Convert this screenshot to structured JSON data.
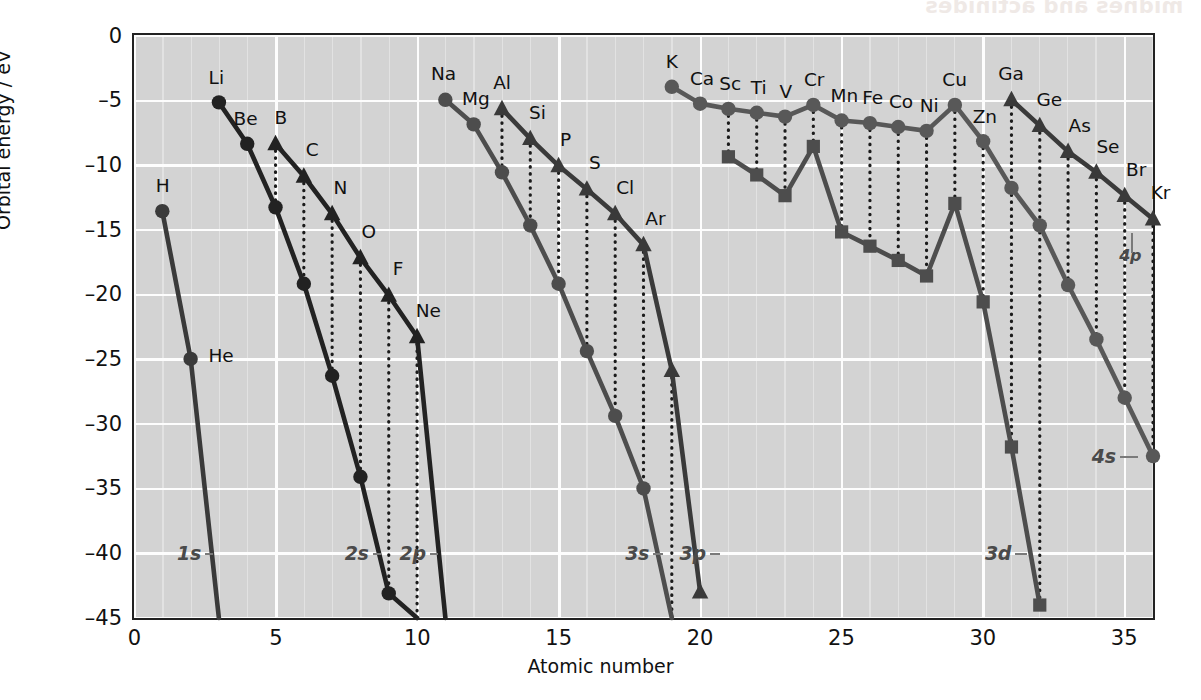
{
  "chart_data": {
    "type": "line",
    "title": "",
    "xlabel": "Atomic number",
    "ylabel": "Orbital energy / eV",
    "xlim": [
      0,
      36
    ],
    "ylim": [
      -45,
      0
    ],
    "xticks": [
      0,
      5,
      10,
      15,
      20,
      25,
      30,
      35
    ],
    "yticks": [
      0,
      -5,
      -10,
      -15,
      -20,
      -25,
      -30,
      -35,
      -40,
      -45
    ],
    "ytick_labels": [
      "0",
      "–5",
      "–10",
      "–15",
      "–20",
      "–25",
      "–30",
      "–35",
      "–40",
      "–45"
    ],
    "xtick_labels": [
      "0",
      "5",
      "10",
      "15",
      "20",
      "25",
      "30",
      "35"
    ],
    "grid": true,
    "grid_color": "#f2f2f2",
    "plot_bg": "#d3d3d3",
    "legend": "inline-annotations",
    "series": [
      {
        "name": "1s",
        "marker": "circle",
        "color": "#3a3a3a",
        "x": [
          1,
          2,
          3
        ],
        "y": [
          -13.6,
          -25.0,
          -45.0
        ],
        "clipped_below": true
      },
      {
        "name": "2s",
        "marker": "circle",
        "color": "#222222",
        "x": [
          3,
          4,
          5,
          6,
          7,
          8,
          9,
          10
        ],
        "y": [
          -5.2,
          -8.4,
          -13.3,
          -19.2,
          -26.3,
          -34.1,
          -43.1,
          -45.0
        ],
        "clipped_below": true
      },
      {
        "name": "2p",
        "marker": "triangle",
        "color": "#222222",
        "x": [
          5,
          6,
          7,
          8,
          9,
          10,
          11
        ],
        "y": [
          -8.4,
          -10.9,
          -13.8,
          -17.2,
          -20.1,
          -23.3,
          -45.0
        ],
        "clipped_below": true
      },
      {
        "name": "3s",
        "marker": "circle",
        "color": "#4d4d4d",
        "x": [
          11,
          12,
          13,
          14,
          15,
          16,
          17,
          18,
          19
        ],
        "y": [
          -5.0,
          -6.9,
          -10.6,
          -14.7,
          -19.2,
          -24.4,
          -29.4,
          -35.0,
          -45.0
        ],
        "clipped_below": true
      },
      {
        "name": "3p",
        "marker": "triangle",
        "color": "#3a3a3a",
        "x": [
          13,
          14,
          15,
          16,
          17,
          18,
          19,
          20
        ],
        "y": [
          -5.7,
          -8.0,
          -10.1,
          -11.9,
          -13.8,
          -16.2,
          -25.9,
          -43.0
        ],
        "clipped_below": false
      },
      {
        "name": "3d",
        "marker": "square",
        "color": "#4d4d4d",
        "x": [
          21,
          22,
          23,
          24,
          25,
          26,
          27,
          28,
          29,
          30,
          31,
          32
        ],
        "y": [
          -9.4,
          -10.8,
          -12.4,
          -8.6,
          -15.2,
          -16.3,
          -17.4,
          -18.6,
          -13.0,
          -20.6,
          -31.8,
          -44.0
        ],
        "clipped_below": false
      },
      {
        "name": "4s",
        "marker": "circle",
        "color": "#585858",
        "x": [
          19,
          20,
          21,
          22,
          23,
          24,
          25,
          26,
          27,
          28,
          29,
          30,
          31,
          32,
          33,
          34,
          35,
          36
        ],
        "y": [
          -4.0,
          -5.3,
          -5.7,
          -6.0,
          -6.3,
          -5.4,
          -6.6,
          -6.8,
          -7.1,
          -7.4,
          -5.4,
          -8.2,
          -11.8,
          -14.7,
          -19.3,
          -23.5,
          -28.0,
          -32.5
        ],
        "clipped_below": false
      },
      {
        "name": "4p",
        "marker": "triangle",
        "color": "#3a3a3a",
        "x": [
          31,
          32,
          33,
          34,
          35,
          36
        ],
        "y": [
          -5.0,
          -7.0,
          -9.0,
          -10.6,
          -12.4,
          -14.2
        ],
        "clipped_below": false
      }
    ],
    "point_labels": [
      {
        "text": "H",
        "x": 1,
        "y": -13.6,
        "dx": 0,
        "dy": -16
      },
      {
        "text": "He",
        "x": 2,
        "y": -25.0,
        "dx": 30,
        "dy": 6
      },
      {
        "text": "Li",
        "x": 3,
        "y": -5.2,
        "dx": -3,
        "dy": -16
      },
      {
        "text": "Be",
        "x": 4,
        "y": -8.4,
        "dx": -2,
        "dy": -16
      },
      {
        "text": "B",
        "x": 5,
        "y": -8.4,
        "dx": 5,
        "dy": -17
      },
      {
        "text": "C",
        "x": 6,
        "y": -10.9,
        "dx": 8,
        "dy": -17
      },
      {
        "text": "N",
        "x": 7,
        "y": -13.8,
        "dx": 8,
        "dy": -17
      },
      {
        "text": "O",
        "x": 8,
        "y": -17.2,
        "dx": 8,
        "dy": -17
      },
      {
        "text": "F",
        "x": 9,
        "y": -20.1,
        "dx": 9,
        "dy": -17
      },
      {
        "text": "Ne",
        "x": 10,
        "y": -23.3,
        "dx": 11,
        "dy": -17
      },
      {
        "text": "Na",
        "x": 11,
        "y": -5.0,
        "dx": -2,
        "dy": -17
      },
      {
        "text": "Mg",
        "x": 12,
        "y": -6.9,
        "dx": 2,
        "dy": -17
      },
      {
        "text": "Al",
        "x": 13,
        "y": -5.7,
        "dx": 0,
        "dy": -17
      },
      {
        "text": "Si",
        "x": 14,
        "y": -8.0,
        "dx": 7,
        "dy": -17
      },
      {
        "text": "P",
        "x": 15,
        "y": -10.1,
        "dx": 7,
        "dy": -17
      },
      {
        "text": "S",
        "x": 16,
        "y": -11.9,
        "dx": 8,
        "dy": -17
      },
      {
        "text": "Cl",
        "x": 17,
        "y": -13.8,
        "dx": 10,
        "dy": -17
      },
      {
        "text": "Ar",
        "x": 18,
        "y": -16.2,
        "dx": 12,
        "dy": -17
      },
      {
        "text": "K",
        "x": 19,
        "y": -4.0,
        "dx": 0,
        "dy": -16
      },
      {
        "text": "Ca",
        "x": 20,
        "y": -5.3,
        "dx": 2,
        "dy": -16
      },
      {
        "text": "Sc",
        "x": 21,
        "y": -5.7,
        "dx": 2,
        "dy": -16
      },
      {
        "text": "Ti",
        "x": 22,
        "y": -6.0,
        "dx": 2,
        "dy": -16
      },
      {
        "text": "V",
        "x": 23,
        "y": -6.3,
        "dx": 1,
        "dy": -16
      },
      {
        "text": "Cr",
        "x": 24,
        "y": -5.4,
        "dx": 1,
        "dy": -16
      },
      {
        "text": "Mn",
        "x": 25,
        "y": -6.6,
        "dx": 3,
        "dy": -16
      },
      {
        "text": "Fe",
        "x": 26,
        "y": -6.8,
        "dx": 3,
        "dy": -16
      },
      {
        "text": "Co",
        "x": 27,
        "y": -7.1,
        "dx": 3,
        "dy": -16
      },
      {
        "text": "Ni",
        "x": 28,
        "y": -7.4,
        "dx": 3,
        "dy": -16
      },
      {
        "text": "Cu",
        "x": 29,
        "y": -5.4,
        "dx": 0,
        "dy": -16
      },
      {
        "text": "Zn",
        "x": 30,
        "y": -8.2,
        "dx": 2,
        "dy": -16
      },
      {
        "text": "Ga",
        "x": 31,
        "y": -5.0,
        "dx": 0,
        "dy": -17
      },
      {
        "text": "Ge",
        "x": 32,
        "y": -7.0,
        "dx": 10,
        "dy": -17
      },
      {
        "text": "As",
        "x": 33,
        "y": -9.0,
        "dx": 12,
        "dy": -17
      },
      {
        "text": "Se",
        "x": 34,
        "y": -10.6,
        "dx": 12,
        "dy": -17
      },
      {
        "text": "Br",
        "x": 35,
        "y": -12.4,
        "dx": 12,
        "dy": -17
      },
      {
        "text": "Kr",
        "x": 36,
        "y": -14.2,
        "dx": 8,
        "dy": -17
      }
    ],
    "orbital_labels": [
      {
        "text": "1s",
        "x": 2.35,
        "y": -40.0,
        "leader_to_x": 2.78
      },
      {
        "text": "2s",
        "x": 8.28,
        "y": -40.0,
        "leader_to_x": 8.72
      },
      {
        "text": "2p",
        "x": 10.3,
        "y": -40.0,
        "leader_to_x": 10.75
      },
      {
        "text": "3s",
        "x": 18.2,
        "y": -40.0,
        "leader_to_x": 18.68
      },
      {
        "text": "3p",
        "x": 20.2,
        "y": -40.0,
        "leader_to_x": 20.7
      },
      {
        "text": "3d",
        "x": 31.0,
        "y": -40.0,
        "leader_to_x": 31.55
      },
      {
        "text": "4s",
        "x": 34.7,
        "y": -32.5,
        "leader_to_x": 35.5
      },
      {
        "text": "4p",
        "x": 35.6,
        "y": -17.0,
        "leader_to_x": 35.25,
        "small": true
      }
    ]
  },
  "ghost_text": "midnes and actinides"
}
